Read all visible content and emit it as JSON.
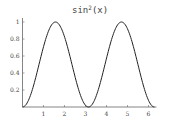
{
  "chart_data": {
    "type": "line",
    "title_base": "sin",
    "title_sup": "2",
    "title_arg": "(x)",
    "xlabel": "",
    "ylabel": "",
    "xlim": [
      0,
      6.2832
    ],
    "ylim": [
      0,
      1
    ],
    "grid": false,
    "legend": null,
    "x_ticks": [
      1,
      2,
      3,
      4,
      5,
      6
    ],
    "x_tick_labels": [
      "1",
      "2",
      "3",
      "4",
      "5",
      "6"
    ],
    "y_ticks": [
      0.2,
      0.4,
      0.6,
      0.8,
      1
    ],
    "y_tick_labels": [
      "0.2",
      "0.4",
      "0.6",
      "0.8",
      "1"
    ],
    "series": [
      {
        "name": "sin^2(x)",
        "color": "#222222",
        "x": [
          0,
          0.3927,
          0.7854,
          1.1781,
          1.5708,
          1.9635,
          2.3562,
          2.7489,
          3.1416,
          3.5343,
          3.927,
          4.3197,
          4.7124,
          5.1051,
          5.4978,
          5.8905,
          6.2832
        ],
        "y": [
          0,
          0.1464,
          0.5,
          0.8536,
          1,
          0.8536,
          0.5,
          0.1464,
          0,
          0.1464,
          0.5,
          0.8536,
          1,
          0.8536,
          0.5,
          0.1464,
          0
        ]
      }
    ]
  }
}
